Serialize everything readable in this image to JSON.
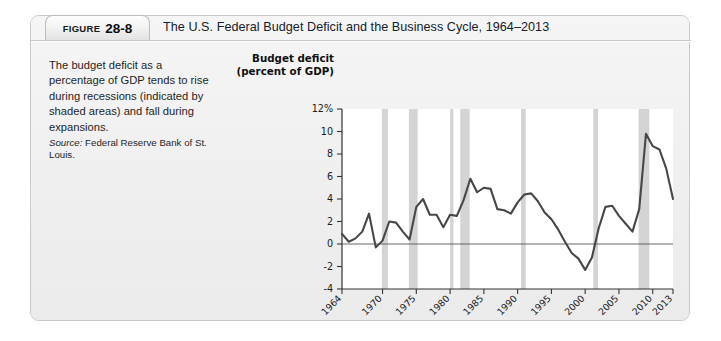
{
  "figure": {
    "label_word": "FIGURE",
    "number": "28-8",
    "title": "The U.S. Federal Budget Deficit and the Business Cycle, 1964–2013"
  },
  "caption": {
    "body": "The budget deficit as a percentage of GDP tends to rise during recessions (indicated by shaded areas) and fall during expansions.",
    "source_word": "Source:",
    "source_text": " Federal Reserve Bank of St. Louis."
  },
  "chart_data": {
    "type": "line",
    "title": "",
    "subtitle": "",
    "ylabel_line1": "Budget deficit",
    "ylabel_line2": "(percent of GDP)",
    "xlabel": "Year",
    "ylim": [
      -4,
      12
    ],
    "xlim": [
      1964,
      2013
    ],
    "grid": false,
    "legend": null,
    "y_ticks": [
      12,
      10,
      8,
      6,
      4,
      2,
      0,
      -2,
      -4
    ],
    "y_tick_labels": [
      "12%",
      "10",
      "8",
      "6",
      "4",
      "2",
      "0",
      "-2",
      "-4"
    ],
    "x_ticks": [
      1964,
      1970,
      1975,
      1980,
      1985,
      1990,
      1995,
      2000,
      2005,
      2010,
      2013
    ],
    "x_tick_labels": [
      "1964",
      "1970",
      "1975",
      "1980",
      "1985",
      "1990",
      "1995",
      "2000",
      "2005",
      "2010",
      "2013"
    ],
    "zero_line": 0,
    "series": [
      {
        "name": "Budget deficit (percent of GDP)",
        "color": "#474747",
        "x": [
          1964,
          1965,
          1966,
          1967,
          1968,
          1969,
          1970,
          1971,
          1972,
          1973,
          1974,
          1975,
          1976,
          1977,
          1978,
          1979,
          1980,
          1981,
          1982,
          1983,
          1984,
          1985,
          1986,
          1987,
          1988,
          1989,
          1990,
          1991,
          1992,
          1993,
          1994,
          1995,
          1996,
          1997,
          1998,
          1999,
          2000,
          2001,
          2002,
          2003,
          2004,
          2005,
          2006,
          2007,
          2008,
          2009,
          2010,
          2011,
          2012,
          2013
        ],
        "values": [
          0.9,
          0.2,
          0.5,
          1.1,
          2.7,
          -0.3,
          0.3,
          2.0,
          1.9,
          1.1,
          0.4,
          3.3,
          4.0,
          2.6,
          2.6,
          1.5,
          2.6,
          2.5,
          3.9,
          5.8,
          4.6,
          5.0,
          4.9,
          3.1,
          3.0,
          2.7,
          3.7,
          4.4,
          4.5,
          3.8,
          2.8,
          2.2,
          1.3,
          0.2,
          -0.8,
          -1.3,
          -2.3,
          -1.2,
          1.4,
          3.3,
          3.4,
          2.5,
          1.8,
          1.1,
          3.1,
          9.8,
          8.7,
          8.4,
          6.7,
          4.0
        ]
      }
    ],
    "recession_bands": [
      {
        "start": 1969.9,
        "end": 1970.8,
        "label": "1969–1970 recession"
      },
      {
        "start": 1973.9,
        "end": 1975.2,
        "label": "1973–1975 recession"
      },
      {
        "start": 1980.0,
        "end": 1980.5,
        "label": "1980 recession"
      },
      {
        "start": 1981.5,
        "end": 1982.9,
        "label": "1981–1982 recession"
      },
      {
        "start": 1990.5,
        "end": 1991.2,
        "label": "1990–1991 recession"
      },
      {
        "start": 2001.2,
        "end": 2001.9,
        "label": "2001 recession"
      },
      {
        "start": 2007.9,
        "end": 2009.5,
        "label": "2007–2009 recession"
      }
    ],
    "band_color": "#d4d4d4",
    "plot_background": "#ffffff",
    "axis_color": "#333333"
  }
}
